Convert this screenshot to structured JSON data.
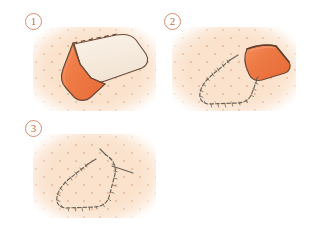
{
  "figure": {
    "type": "instructional-diagram",
    "background_color": "#ffffff",
    "panel_count": 3
  },
  "palette": {
    "page_background": "#ffffff",
    "fabric_background": "#fae2cc",
    "fabric_dot": "#d68c68",
    "fabric_orange": "#ee7a45",
    "fabric_orange_shadow": "#e0693a",
    "fabric_cream": "#f6ece0",
    "outline_brown": "#6b4b3a",
    "stitch_thread": "#6b6257",
    "marker_ring": "#d98b72",
    "marker_text": "#c86a4e"
  },
  "steps": [
    {
      "id": "step-1",
      "number": "1",
      "caption": "",
      "elements": {
        "cream_flap_label": "unfolded fabric panel",
        "orange_panel_label": "folded pocket face",
        "fold_line_label": "dashed fold line"
      }
    },
    {
      "id": "step-2",
      "number": "2",
      "caption": "",
      "elements": {
        "stitch_line_label": "basting stitch outline",
        "orange_panel_label": "lifted orange flap"
      }
    },
    {
      "id": "step-3",
      "number": "3",
      "caption": "",
      "elements": {
        "stitch_line_label": "completed basting stitch outline",
        "thread_tail_label": "thread tail"
      }
    }
  ]
}
